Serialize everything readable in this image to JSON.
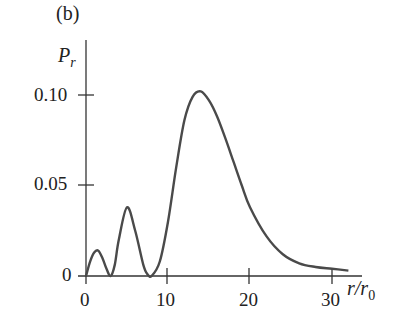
{
  "chart_data": {
    "type": "line",
    "panel_label": "(b)",
    "title": "",
    "xlabel": "r/r0",
    "ylabel": "Pr",
    "xlim": [
      0,
      32
    ],
    "ylim": [
      0,
      0.11
    ],
    "x_ticks": [
      "0",
      "10",
      "20",
      "30"
    ],
    "y_ticks": [
      "0",
      "0.05",
      "0.10"
    ],
    "grid": false,
    "legend": null,
    "series": [
      {
        "name": "radial probability density",
        "x": [
          0,
          0.5,
          1,
          1.5,
          2,
          2.5,
          3,
          3.5,
          4,
          5,
          6,
          7,
          7.5,
          8,
          9,
          10,
          11,
          12,
          13,
          14,
          15,
          16,
          17,
          18,
          19,
          20,
          22,
          24,
          26,
          28,
          30,
          32
        ],
        "y": [
          0,
          0.008,
          0.013,
          0.014,
          0.01,
          0.004,
          0.0,
          0.006,
          0.02,
          0.038,
          0.025,
          0.006,
          0.001,
          0.0,
          0.008,
          0.03,
          0.06,
          0.086,
          0.099,
          0.102,
          0.097,
          0.088,
          0.076,
          0.063,
          0.05,
          0.038,
          0.022,
          0.012,
          0.007,
          0.005,
          0.004,
          0.003
        ]
      }
    ]
  },
  "labels": {
    "panel": "(b)",
    "y_axis": "P",
    "y_axis_sub": "r",
    "x_axis": "r/r",
    "x_axis_sub": "0",
    "ytick_0": "0",
    "ytick_005": "0.05",
    "ytick_010": "0.10",
    "xtick_0": "0",
    "xtick_10": "10",
    "xtick_20": "20",
    "xtick_30": "30"
  }
}
